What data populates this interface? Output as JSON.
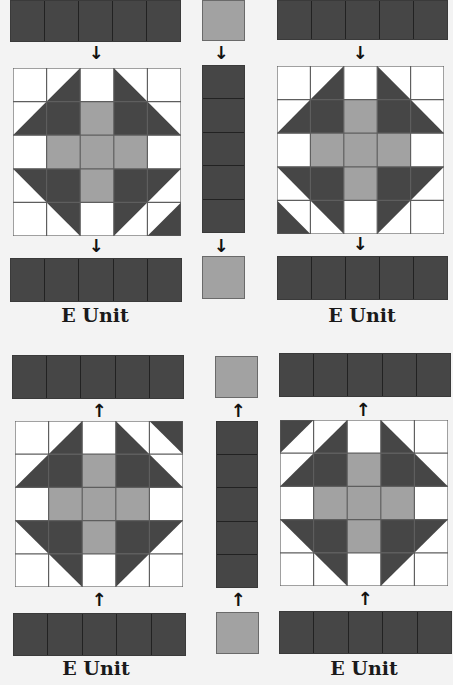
{
  "colors": {
    "background": "#f3f3f3",
    "dark": "#464646",
    "medium": "#a2a2a2",
    "light": "#ffffff",
    "grid": "#5e5e5e",
    "arrow": "#111111"
  },
  "labels": {
    "unit_top_left": "E Unit",
    "unit_top_right": "E Unit",
    "unit_bottom_left": "E Unit",
    "unit_bottom_right": "E Unit"
  },
  "arrows": {
    "down": "↓",
    "up": "↑"
  },
  "block_grid": {
    "rows": 5,
    "cols": 5,
    "variants": {
      "top_left": "corner triangle bottom-right",
      "top_right": "corner triangle bottom-left",
      "bottom_left": "corner triangle top-right",
      "bottom_right": "corner triangle top-left"
    }
  },
  "strip_segments": 5
}
